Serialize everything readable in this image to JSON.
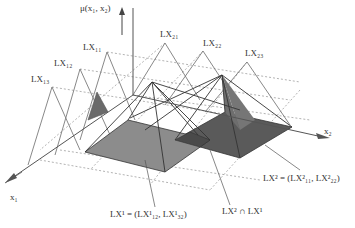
{
  "axes": {
    "mu": {
      "label": "μ(x₁, x₂)"
    },
    "x1": {
      "label": "x₁"
    },
    "x2": {
      "label": "x₂"
    }
  },
  "membership_labels": {
    "lx11": "LX₁₁",
    "lx12": "LX₁₂",
    "lx13": "LX₁₃",
    "lx21": "LX₂₁",
    "lx22": "LX₂₂",
    "lx23": "LX₂₃"
  },
  "callouts": {
    "lx1": "LX¹ = (LX¹₁₂, LX¹₃₂)",
    "lx2": "LX² = (LX²₁₁, LX²₂₂)",
    "intersection": "LX² ∩ LX¹"
  },
  "colors": {
    "line": "#555555",
    "dashed": "#9a9a9a",
    "base_light": "#8c8c8c",
    "base_dark": "#5a5a5a",
    "face_shade": "#6e6e6e",
    "triangle_fill": "#6a6a6a"
  }
}
